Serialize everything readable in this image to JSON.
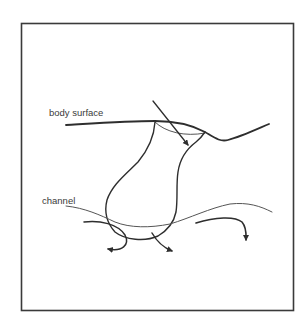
{
  "figure": {
    "labels": {
      "body_surface": "body surface",
      "channel": "channel"
    },
    "elements": [
      "frame",
      "body-surface-line",
      "sensory-pit (flask-shaped invagination)",
      "membrane across pit opening",
      "incoming arrow (straight, into pit)",
      "channel line",
      "flow arrows (three curved arrows below channel)"
    ],
    "colors": {
      "stroke": "#2e2e2e",
      "thin_stroke": "#555555",
      "background": "#ffffff",
      "text": "#3a3a3a"
    }
  }
}
